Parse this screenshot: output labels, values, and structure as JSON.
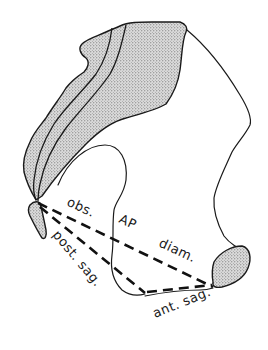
{
  "figure": {
    "type": "anatomical-line-drawing",
    "colors": {
      "line": "#1a1a1a",
      "stipple_bg": "#d9d9d9",
      "stipple_dot": "#555555",
      "background": "#ffffff"
    },
    "labels": {
      "obs": "obs.",
      "ap": "AP",
      "diam": "diam.",
      "post_sag": "post. sag.",
      "ant_sag": "ant. sag."
    },
    "structures": [
      "ilium-shaded",
      "sacrum-tip-shaded",
      "pubic-symphysis-shaded",
      "pelvic-outline",
      "obturator-curve"
    ],
    "measurements": [
      {
        "name": "obstetric AP diameter",
        "label": "obs. AP diam.",
        "style": "dashed"
      },
      {
        "name": "posterior sagittal",
        "label": "post. sag.",
        "style": "dashed"
      },
      {
        "name": "anterior sagittal",
        "label": "ant. sag.",
        "style": "dashed"
      }
    ]
  }
}
